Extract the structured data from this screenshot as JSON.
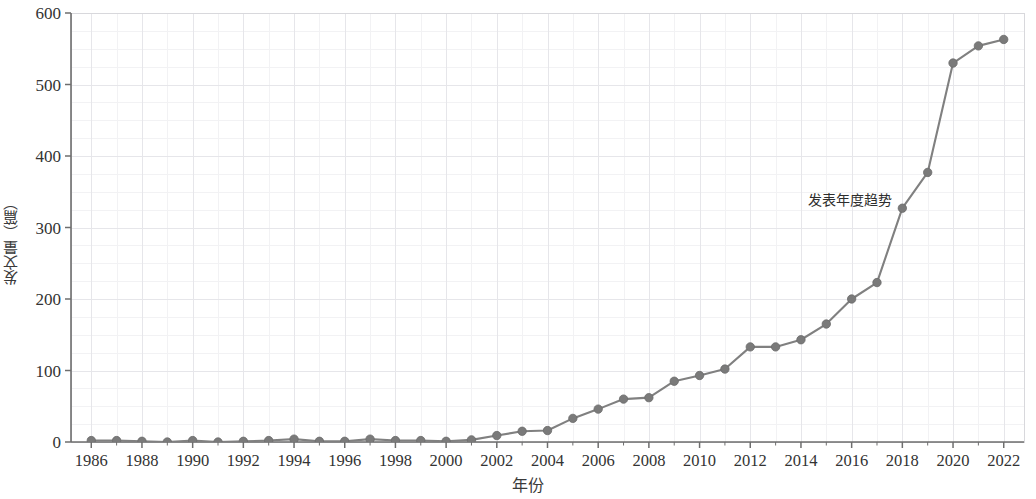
{
  "chart_data": {
    "type": "line",
    "title": "",
    "xlabel": "年份",
    "ylabel": "发文量（篇）",
    "annotation": "发表年度趋势",
    "xlim": [
      1985.2,
      2022.8
    ],
    "ylim": [
      0,
      600
    ],
    "y_ticks": [
      0,
      100,
      200,
      300,
      400,
      500,
      600
    ],
    "x_ticks": [
      1986,
      1988,
      1990,
      1992,
      1994,
      1996,
      1998,
      2000,
      2002,
      2004,
      2006,
      2008,
      2010,
      2012,
      2014,
      2016,
      2018,
      2020,
      2022
    ],
    "grid": true,
    "legend": "none",
    "line_color": "#808080",
    "marker_color": "#7a7a7a",
    "x": [
      1986,
      1987,
      1988,
      1989,
      1990,
      1991,
      1992,
      1993,
      1994,
      1995,
      1996,
      1997,
      1998,
      1999,
      2000,
      2001,
      2002,
      2003,
      2004,
      2005,
      2006,
      2007,
      2008,
      2009,
      2010,
      2011,
      2012,
      2013,
      2014,
      2015,
      2016,
      2017,
      2018,
      2019,
      2020,
      2021,
      2022
    ],
    "values": [
      2,
      2,
      1,
      0,
      2,
      0,
      1,
      2,
      4,
      1,
      1,
      4,
      2,
      2,
      1,
      3,
      9,
      15,
      16,
      33,
      46,
      60,
      62,
      85,
      93,
      102,
      133,
      133,
      143,
      165,
      200,
      223,
      327,
      377,
      530,
      554,
      563
    ],
    "series": [
      {
        "name": "发表年度趋势",
        "values": [
          2,
          2,
          1,
          0,
          2,
          0,
          1,
          2,
          4,
          1,
          1,
          4,
          2,
          2,
          1,
          3,
          9,
          15,
          16,
          33,
          46,
          60,
          62,
          85,
          93,
          102,
          133,
          133,
          143,
          165,
          200,
          223,
          327,
          377,
          530,
          554,
          563
        ]
      }
    ]
  }
}
